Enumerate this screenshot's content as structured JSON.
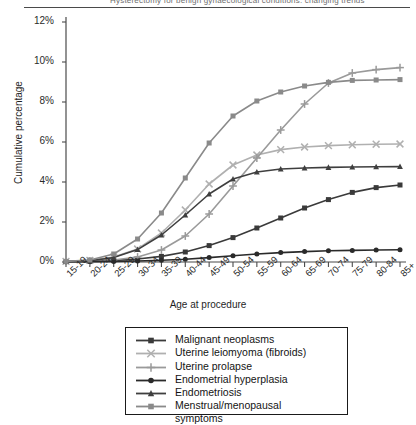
{
  "runhead": {
    "text": "Hysterectomy for benign gynaecological conditions: changing trends"
  },
  "axes": {
    "ylabel": "Cumulative percentage",
    "xlabel": "Age at procedure",
    "yticks": [
      "0%",
      "2%",
      "4%",
      "6%",
      "8%",
      "10%",
      "12%"
    ]
  },
  "legend": {
    "items": [
      {
        "label": "Malignant neoplasms",
        "marker": "square",
        "color": "#3a3a3a"
      },
      {
        "label": "Uterine leiomyoma (fibroids)",
        "marker": "x",
        "color": "#b0b0b0"
      },
      {
        "label": "Uterine prolapse",
        "marker": "plus",
        "color": "#9a9a9a"
      },
      {
        "label": "Endometrial hyperplasia",
        "marker": "circle",
        "color": "#2a2a2a"
      },
      {
        "label": "Endometriosis",
        "marker": "triangle",
        "color": "#3f3f3f"
      },
      {
        "label": "Menstrual/menopausal\nsymptoms",
        "marker": "square",
        "color": "#8a8a8a"
      }
    ]
  },
  "chart_data": {
    "type": "line",
    "title": "",
    "xlabel": "Age at procedure",
    "ylabel": "Cumulative percentage",
    "ylim": [
      0,
      12
    ],
    "yticks": [
      0,
      2,
      4,
      6,
      8,
      10,
      12
    ],
    "grid": false,
    "legend_position": "bottom",
    "categories": [
      "15-19",
      "20-24",
      "25-29",
      "30-34",
      "35-39",
      "40-44",
      "45-49",
      "50-54",
      "55-59",
      "60-64",
      "65-69",
      "70-74",
      "75-79",
      "80-84",
      "85+"
    ],
    "series": [
      {
        "name": "Malignant neoplasms",
        "marker": "square",
        "color": "#3a3a3a",
        "values": [
          0.02,
          0.04,
          0.08,
          0.15,
          0.28,
          0.5,
          0.82,
          1.22,
          1.7,
          2.2,
          2.7,
          3.12,
          3.48,
          3.72,
          3.85
        ]
      },
      {
        "name": "Uterine leiomyoma (fibroids)",
        "marker": "x",
        "color": "#b0b0b0",
        "values": [
          0.03,
          0.08,
          0.25,
          0.65,
          1.45,
          2.6,
          3.9,
          4.85,
          5.35,
          5.62,
          5.75,
          5.82,
          5.86,
          5.89,
          5.9
        ]
      },
      {
        "name": "Uterine prolapse",
        "marker": "plus",
        "color": "#9a9a9a",
        "values": [
          0.02,
          0.04,
          0.1,
          0.25,
          0.6,
          1.3,
          2.4,
          3.8,
          5.2,
          6.6,
          7.9,
          8.95,
          9.45,
          9.62,
          9.72
        ]
      },
      {
        "name": "Endometrial hyperplasia",
        "marker": "circle",
        "color": "#2a2a2a",
        "values": [
          0.01,
          0.02,
          0.03,
          0.05,
          0.09,
          0.14,
          0.22,
          0.31,
          0.4,
          0.47,
          0.52,
          0.56,
          0.58,
          0.6,
          0.61
        ]
      },
      {
        "name": "Endometriosis",
        "marker": "triangle",
        "color": "#3f3f3f",
        "values": [
          0.02,
          0.06,
          0.22,
          0.62,
          1.35,
          2.35,
          3.4,
          4.15,
          4.5,
          4.65,
          4.7,
          4.73,
          4.75,
          4.76,
          4.77
        ]
      },
      {
        "name": "Menstrual/menopausal symptoms",
        "marker": "square",
        "color": "#8a8a8a",
        "values": [
          0.03,
          0.1,
          0.4,
          1.15,
          2.45,
          4.2,
          5.95,
          7.3,
          8.05,
          8.5,
          8.8,
          8.98,
          9.08,
          9.1,
          9.12
        ]
      }
    ]
  }
}
